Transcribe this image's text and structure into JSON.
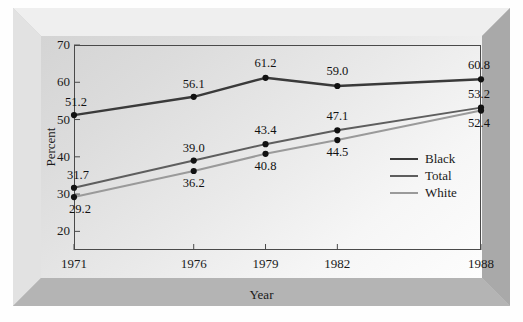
{
  "figure": {
    "frame_style": "beveled-3d-gray"
  },
  "chart_data": {
    "type": "line",
    "title": "",
    "xlabel": "Year",
    "ylabel": "Percent",
    "x": [
      1971,
      1976,
      1979,
      1982,
      1988
    ],
    "categories": [
      "1971",
      "1976",
      "1979",
      "1982",
      "1988"
    ],
    "xlim": [
      1971,
      1988
    ],
    "ylim": [
      15,
      70
    ],
    "yticks": [
      20,
      30,
      40,
      50,
      60,
      70
    ],
    "ytick_labels": [
      "20",
      "30",
      "40",
      "50",
      "60",
      "70"
    ],
    "xticks": [
      1971,
      1976,
      1979,
      1982,
      1988
    ],
    "xtick_labels": [
      "1971",
      "1976",
      "1979",
      "1982",
      "1988"
    ],
    "grid": false,
    "legend_position": "center-right",
    "markers": "filled-circle",
    "series": [
      {
        "name": "Black",
        "color": "#3a3a3a",
        "width": 2.4,
        "values": [
          51.2,
          56.1,
          61.2,
          59.0,
          60.8
        ],
        "labels": [
          "51.2",
          "56.1",
          "61.2",
          "59.0",
          "60.8"
        ]
      },
      {
        "name": "Total",
        "color": "#5e5e5e",
        "width": 2.0,
        "values": [
          31.7,
          39.0,
          43.4,
          47.1,
          53.2
        ],
        "labels": [
          "31.7",
          "39.0",
          "43.4",
          "47.1",
          "53.2"
        ]
      },
      {
        "name": "White",
        "color": "#9a9a9a",
        "width": 2.0,
        "values": [
          29.2,
          36.2,
          40.8,
          44.5,
          52.4
        ],
        "labels": [
          "29.2",
          "36.2",
          "40.8",
          "44.5",
          "52.4"
        ]
      }
    ]
  },
  "legend": {
    "items": [
      {
        "label": "Black",
        "color": "#3a3a3a"
      },
      {
        "label": "Total",
        "color": "#5e5e5e"
      },
      {
        "label": "White",
        "color": "#9a9a9a"
      }
    ]
  }
}
